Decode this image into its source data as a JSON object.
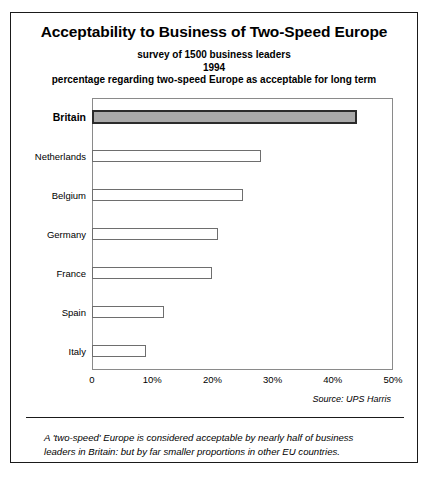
{
  "title": "Acceptability to Business of Two-Speed Europe",
  "subtitles": [
    "survey of 1500 business leaders",
    "1994",
    "percentage regarding two-speed Europe as acceptable for long term"
  ],
  "source": "Source: UPS Harris",
  "footnote": [
    "A 'two-speed' Europe is considered acceptable by nearly half of business",
    "leaders in Britain: but by far smaller proportions in other EU countries."
  ],
  "chart_data": {
    "type": "bar",
    "orientation": "horizontal",
    "title": "Acceptability to Business of Two-Speed Europe",
    "subtitle": "survey of 1500 business leaders / 1994 / percentage regarding two-speed Europe as acceptable for long term",
    "categories": [
      "Britain",
      "Netherlands",
      "Belgium",
      "Germany",
      "France",
      "Spain",
      "Italy"
    ],
    "values": [
      44,
      28,
      25,
      21,
      20,
      12,
      9
    ],
    "highlight_category": "Britain",
    "highlight_color": "#a9a9a9",
    "bar_color": "#ffffff",
    "bar_border_color": "#6e6e6e",
    "xlabel": "",
    "ylabel": "",
    "xlim": [
      0,
      50
    ],
    "xticks": [
      0,
      10,
      20,
      30,
      40,
      50
    ],
    "xtick_labels": [
      "0",
      "10%",
      "20%",
      "30%",
      "40%",
      "50%"
    ],
    "grid": false,
    "legend": false,
    "source": "Source: UPS Harris"
  }
}
